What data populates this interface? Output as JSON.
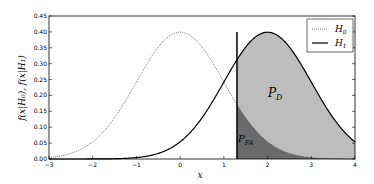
{
  "chart_data": {
    "type": "line",
    "title": "",
    "xlabel": "x",
    "ylabel": "f(x|H0), f(x|H1)",
    "xlim": [
      -3,
      4
    ],
    "ylim": [
      0,
      0.45
    ],
    "xticks": [
      "-3",
      "-2",
      "-1",
      "0",
      "1",
      "2",
      "3",
      "4"
    ],
    "yticks": [
      "0.00",
      "0.05",
      "0.10",
      "0.15",
      "0.20",
      "0.25",
      "0.30",
      "0.35",
      "0.40",
      "0.45"
    ],
    "series": [
      {
        "name": "H0",
        "style": "dotted",
        "mean": 0,
        "std": 1
      },
      {
        "name": "H1",
        "style": "solid",
        "mean": 2,
        "std": 1
      }
    ],
    "threshold": 1.3,
    "annotations": [
      "P_D",
      "P_FA"
    ],
    "legend": {
      "position": "upper right",
      "entries": [
        "H0",
        "H1"
      ]
    },
    "grid": false
  },
  "labels": {
    "pd": "P",
    "pd_sub": "D",
    "pfa": "P",
    "pfa_sub": "FA",
    "h0": "H",
    "h0_sub": "0",
    "h1": "H",
    "h1_sub": "1",
    "xlabel": "x"
  }
}
